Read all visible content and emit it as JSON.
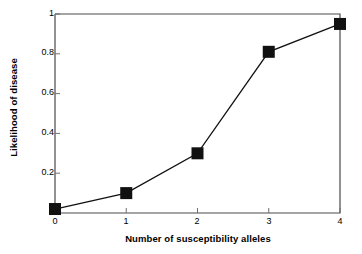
{
  "chart_data": {
    "type": "line",
    "title": "",
    "xlabel": "Number of susceptibility alleles",
    "ylabel": "Likelihood of disease",
    "x": [
      0,
      1,
      2,
      3,
      4
    ],
    "values": [
      0.02,
      0.1,
      0.3,
      0.81,
      0.95
    ],
    "xlim": [
      0,
      4
    ],
    "ylim": [
      0,
      1
    ],
    "xticks": [
      "0",
      "1",
      "2",
      "3",
      "4"
    ],
    "yticks": [
      "0",
      "0.2",
      "0.4",
      "0.6",
      "0.8",
      "1"
    ],
    "ytick_values": [
      0,
      0.2,
      0.4,
      0.6,
      0.8,
      1
    ],
    "grid": false,
    "legend": null,
    "marker": "square",
    "marker_color": "#111111",
    "line_color": "#111111",
    "axis_color": "#555555",
    "background": "#ffffff"
  }
}
